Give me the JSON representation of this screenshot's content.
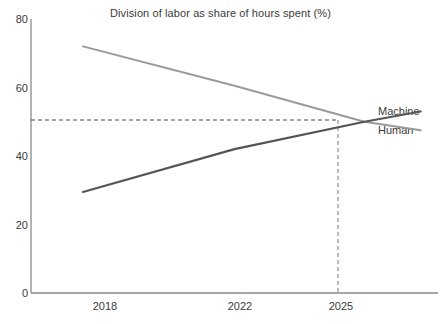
{
  "chart_data": {
    "type": "line",
    "title": "Division of labor as share of hours spent (%)",
    "xlabel": "",
    "ylabel": "",
    "xlim": [
      2016.8,
      2026.2
    ],
    "ylim": [
      0,
      80
    ],
    "xticks": [
      "2018",
      "2022",
      "2025"
    ],
    "xtick_values": [
      2018,
      2022,
      2025
    ],
    "yticks": [
      "0",
      "20",
      "40",
      "60",
      "80"
    ],
    "ytick_values": [
      0,
      20,
      40,
      60,
      80
    ],
    "grid": false,
    "legend_position": "right-of-lines",
    "series": [
      {
        "name": "Machine",
        "color": "#555555",
        "x": [
          2018,
          2021.5,
          2024.5,
          2025.8
        ],
        "values": [
          29.5,
          42.0,
          50.0,
          53.0
        ]
      },
      {
        "name": "Human",
        "color": "#9a9a9a",
        "x": [
          2018,
          2021.5,
          2024.5,
          2025.8
        ],
        "values": [
          72.0,
          60.5,
          50.0,
          47.5
        ]
      }
    ],
    "annotations": [
      {
        "type": "crossover",
        "x": 2024.5,
        "y": 50,
        "guide_horizontal": true,
        "guide_vertical": true,
        "guide_style": "dashed",
        "guide_color": "#444444"
      }
    ]
  },
  "axes": {
    "y_labels": [
      "80",
      "60",
      "40",
      "20",
      "0"
    ],
    "x_labels": [
      "2018",
      "2022",
      "2025"
    ],
    "axis_color": "#8a8a8a"
  },
  "legend": {
    "machine_label": "Machine",
    "human_label": "Human"
  }
}
